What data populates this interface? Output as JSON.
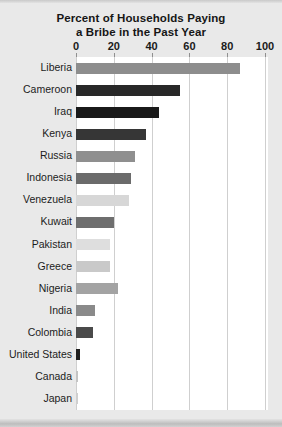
{
  "chart_data": {
    "type": "bar",
    "orientation": "horizontal",
    "title": "Percent of Households Paying a Bribe in the Past Year",
    "title_line1": "Percent of Households Paying",
    "title_line2": "a Bribe in the Past Year",
    "xlabel": "",
    "ylabel": "",
    "xlim": [
      0,
      100
    ],
    "xticks": [
      0,
      20,
      40,
      60,
      80,
      100
    ],
    "xtick_labels": [
      "0",
      "20",
      "40",
      "60",
      "80",
      "100"
    ],
    "grid": "vertical",
    "legend": "none",
    "categories": [
      "Liberia",
      "Cameroon",
      "Iraq",
      "Kenya",
      "Russia",
      "Indonesia",
      "Venezuela",
      "Kuwait",
      "Pakistan",
      "Greece",
      "Nigeria",
      "India",
      "Colombia",
      "United States",
      "Canada",
      "Japan"
    ],
    "values": [
      87,
      55,
      44,
      37,
      31,
      29,
      28,
      20,
      18,
      18,
      22,
      10,
      9,
      2,
      1,
      1
    ],
    "bar_colors": [
      "#8d8d8d",
      "#282828",
      "#191919",
      "#363636",
      "#8f8f8f",
      "#6b6b6b",
      "#d7d7d7",
      "#6e6e6e",
      "#dedede",
      "#c9c9c9",
      "#a3a3a3",
      "#8a8a8a",
      "#4a4a4a",
      "#1e1e1e",
      "#c4c4c4",
      "#cfcfcf"
    ],
    "bars": [
      {
        "label": "Liberia",
        "value": 87,
        "color": "#8d8d8d"
      },
      {
        "label": "Cameroon",
        "value": 55,
        "color": "#282828"
      },
      {
        "label": "Iraq",
        "value": 44,
        "color": "#191919"
      },
      {
        "label": "Kenya",
        "value": 37,
        "color": "#363636"
      },
      {
        "label": "Russia",
        "value": 31,
        "color": "#8f8f8f"
      },
      {
        "label": "Indonesia",
        "value": 29,
        "color": "#6b6b6b"
      },
      {
        "label": "Venezuela",
        "value": 28,
        "color": "#d7d7d7"
      },
      {
        "label": "Kuwait",
        "value": 20,
        "color": "#6e6e6e"
      },
      {
        "label": "Pakistan",
        "value": 18,
        "color": "#dedede"
      },
      {
        "label": "Greece",
        "value": 18,
        "color": "#c9c9c9"
      },
      {
        "label": "Nigeria",
        "value": 22,
        "color": "#a3a3a3"
      },
      {
        "label": "India",
        "value": 10,
        "color": "#8a8a8a"
      },
      {
        "label": "Colombia",
        "value": 9,
        "color": "#4a4a4a"
      },
      {
        "label": "United States",
        "value": 2,
        "color": "#1e1e1e"
      },
      {
        "label": "Canada",
        "value": 1,
        "color": "#c4c4c4"
      },
      {
        "label": "Japan",
        "value": 1,
        "color": "#cfcfcf"
      }
    ]
  },
  "colors": {
    "page_background": "#e9e9e9",
    "plot_background": "#ffffff",
    "gridline": "#cfcfcf",
    "text": "#1a1a1a"
  }
}
